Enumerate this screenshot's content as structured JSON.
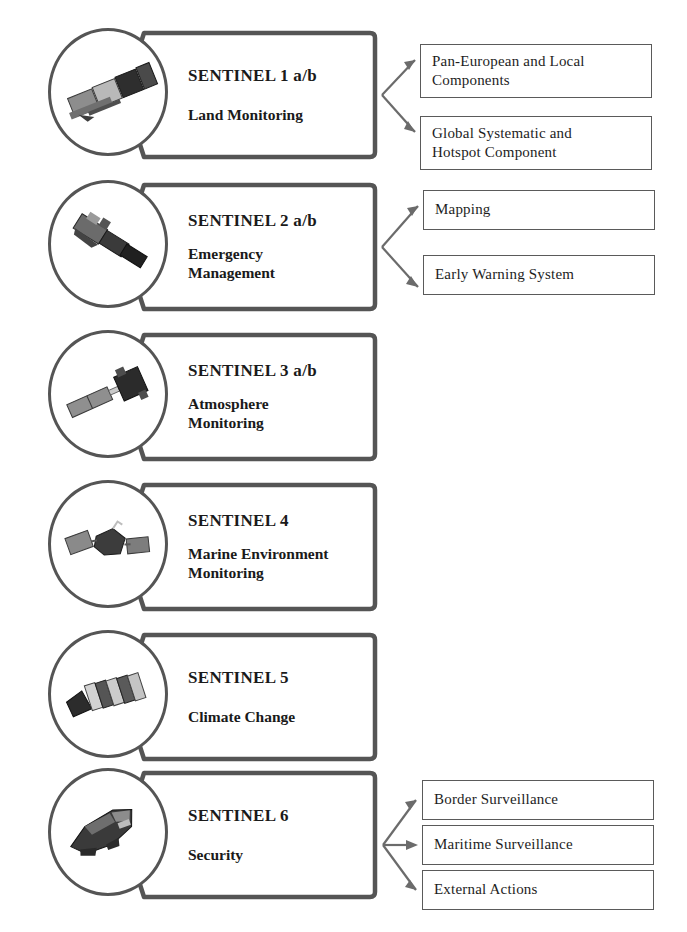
{
  "diagram": {
    "colors": {
      "box_stroke": "#555555",
      "subbox_stroke": "#5a5a5a",
      "text": "#1a1a1a",
      "background": "#ffffff",
      "connector": "#6b6b6b"
    },
    "rows": [
      {
        "id": "sentinel-1",
        "icon": "satellite-icon",
        "title": "SENTINEL 1 a/b",
        "theme": "Land Monitoring",
        "theme_lines": [
          "Land Monitoring"
        ],
        "services": [
          {
            "id": "pan-european-and-local-components",
            "lines": [
              "Pan-European and Local",
              "Components"
            ]
          },
          {
            "id": "global-systematic-and-hotspot-component",
            "lines": [
              "Global Systematic and",
              "Hotspot Component"
            ]
          }
        ]
      },
      {
        "id": "sentinel-2",
        "icon": "satellite-icon",
        "title": "SENTINEL 2 a/b",
        "theme": "Emergency Management",
        "theme_lines": [
          "Emergency",
          "Management"
        ],
        "services": [
          {
            "id": "mapping",
            "lines": [
              "Mapping"
            ]
          },
          {
            "id": "early-warning-system",
            "lines": [
              "Early  Warning  System"
            ]
          }
        ]
      },
      {
        "id": "sentinel-3",
        "icon": "satellite-icon",
        "title": "SENTINEL 3 a/b",
        "theme": "Atmosphere Monitoring",
        "theme_lines": [
          "Atmosphere",
          "Monitoring"
        ],
        "services": []
      },
      {
        "id": "sentinel-4",
        "icon": "satellite-icon",
        "title": "SENTINEL 4",
        "theme": "Marine Environment Monitoring",
        "theme_lines": [
          "Marine Environment",
          "Monitoring"
        ],
        "services": []
      },
      {
        "id": "sentinel-5",
        "icon": "satellite-icon",
        "title": "SENTINEL 5",
        "theme": "Climate Change",
        "theme_lines": [
          "Climate Change"
        ],
        "services": []
      },
      {
        "id": "sentinel-6",
        "icon": "satellite-icon",
        "title": "SENTINEL 6",
        "theme": "Security",
        "theme_lines": [
          "Security"
        ],
        "services": [
          {
            "id": "border-surveillance",
            "lines": [
              "Border Surveillance"
            ]
          },
          {
            "id": "maritime-surveillance",
            "lines": [
              "Maritime  Surveillance"
            ]
          },
          {
            "id": "external-actions",
            "lines": [
              "External  Actions"
            ]
          }
        ]
      }
    ]
  }
}
